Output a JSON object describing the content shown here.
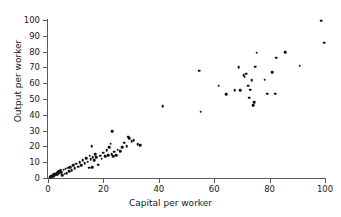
{
  "chart_data": {
    "type": "scatter",
    "title": "",
    "xlabel": "Capital per worker",
    "ylabel": "Output per worker",
    "xlim": [
      0,
      100
    ],
    "ylim": [
      0,
      100
    ],
    "xticks": [
      0,
      20,
      40,
      60,
      80,
      100
    ],
    "yticks": [
      0,
      10,
      20,
      30,
      40,
      50,
      60,
      70,
      80,
      90,
      100
    ],
    "grid": false,
    "legend": null,
    "marker": {
      "shape": "circle",
      "color": "#111111",
      "size": 2.6
    },
    "series": [
      {
        "name": "countries",
        "points": [
          [
            0.7,
            0.6
          ],
          [
            1.0,
            1.0
          ],
          [
            1.2,
            0.7
          ],
          [
            1.4,
            1.4
          ],
          [
            1.6,
            0.9
          ],
          [
            1.8,
            2.0
          ],
          [
            2.0,
            1.2
          ],
          [
            2.2,
            2.3
          ],
          [
            2.4,
            1.6
          ],
          [
            2.6,
            2.8
          ],
          [
            2.9,
            2.0
          ],
          [
            3.1,
            3.2
          ],
          [
            3.3,
            2.4
          ],
          [
            3.5,
            3.6
          ],
          [
            3.8,
            2.8
          ],
          [
            4.0,
            4.2
          ],
          [
            4.3,
            3.3
          ],
          [
            4.6,
            4.8
          ],
          [
            4.9,
            3.8
          ],
          [
            5.2,
            1.9
          ],
          [
            5.6,
            5.3
          ],
          [
            6.0,
            2.6
          ],
          [
            6.4,
            5.8
          ],
          [
            6.8,
            3.2
          ],
          [
            7.2,
            6.4
          ],
          [
            7.6,
            4.4
          ],
          [
            8.0,
            7.0
          ],
          [
            8.5,
            5.0
          ],
          [
            9.0,
            8.2
          ],
          [
            9.6,
            6.2
          ],
          [
            10.2,
            9.0
          ],
          [
            10.8,
            7.1
          ],
          [
            11.4,
            10.0
          ],
          [
            12.0,
            8.0
          ],
          [
            12.6,
            11.2
          ],
          [
            13.2,
            9.2
          ],
          [
            13.8,
            12.6
          ],
          [
            14.4,
            10.3
          ],
          [
            15.0,
            14.0
          ],
          [
            15.4,
            12.0
          ],
          [
            15.8,
            20.2
          ],
          [
            16.2,
            13.3
          ],
          [
            16.6,
            11.2
          ],
          [
            17.0,
            15.0
          ],
          [
            17.4,
            13.0
          ],
          [
            14.8,
            6.6
          ],
          [
            16.0,
            7.0
          ],
          [
            18.2,
            8.4
          ],
          [
            18.8,
            14.2
          ],
          [
            19.4,
            12.2
          ],
          [
            20.0,
            16.0
          ],
          [
            20.6,
            13.8
          ],
          [
            21.2,
            17.6
          ],
          [
            21.8,
            14.6
          ],
          [
            22.2,
            19.6
          ],
          [
            22.6,
            21.6
          ],
          [
            23.0,
            15.0
          ],
          [
            23.2,
            29.6
          ],
          [
            23.6,
            13.7
          ],
          [
            24.0,
            16.6
          ],
          [
            24.6,
            14.3
          ],
          [
            25.2,
            18.0
          ],
          [
            26.0,
            17.0
          ],
          [
            26.8,
            19.4
          ],
          [
            27.6,
            22.4
          ],
          [
            28.4,
            20.0
          ],
          [
            29.0,
            26.2
          ],
          [
            29.4,
            25.2
          ],
          [
            30.2,
            23.4
          ],
          [
            31.0,
            24.0
          ],
          [
            32.4,
            21.4
          ],
          [
            33.2,
            20.6
          ],
          [
            41.4,
            45.4
          ],
          [
            54.6,
            68.0
          ],
          [
            55.2,
            42.0
          ],
          [
            61.6,
            58.4
          ],
          [
            64.4,
            53.0
          ],
          [
            67.4,
            55.4
          ],
          [
            68.8,
            70.2
          ],
          [
            69.4,
            55.6
          ],
          [
            70.6,
            65.0
          ],
          [
            71.0,
            64.0
          ],
          [
            71.6,
            66.0
          ],
          [
            72.2,
            58.4
          ],
          [
            72.6,
            50.8
          ],
          [
            73.0,
            56.0
          ],
          [
            73.6,
            62.0
          ],
          [
            74.0,
            46.0
          ],
          [
            74.4,
            48.0
          ],
          [
            74.8,
            70.4
          ],
          [
            75.4,
            79.4
          ],
          [
            78.2,
            62.2
          ],
          [
            79.2,
            53.4
          ],
          [
            81.0,
            67.0
          ],
          [
            82.0,
            53.4
          ],
          [
            82.4,
            76.2
          ],
          [
            85.6,
            79.8
          ],
          [
            90.8,
            71.2
          ],
          [
            98.6,
            99.6
          ],
          [
            99.8,
            85.6
          ]
        ]
      }
    ]
  },
  "axis": {
    "x_tick_labels": [
      "0",
      "20",
      "40",
      "60",
      "80",
      "100"
    ],
    "y_tick_labels": [
      "0",
      "10",
      "20",
      "30",
      "40",
      "50",
      "60",
      "70",
      "80",
      "90",
      "100"
    ]
  },
  "colors": {
    "marker": "#111111",
    "axis": "#5a5a5a",
    "text": "#1a1a1a",
    "background": "#ffffff"
  }
}
